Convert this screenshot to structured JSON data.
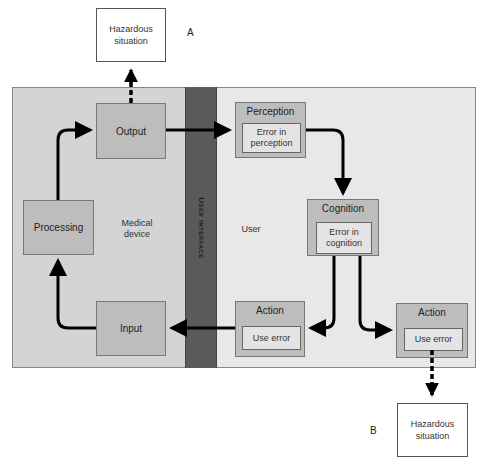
{
  "hazard_top": {
    "line1": "Hazardous",
    "line2": "situation"
  },
  "hazard_bottom": {
    "line1": "Hazardous",
    "line2": "situation"
  },
  "label_a": "A",
  "label_b": "B",
  "device_area": {
    "label_line1": "Medical",
    "label_line2": "device"
  },
  "user_area": {
    "label": "User"
  },
  "user_interface": {
    "label": "User interface"
  },
  "device_boxes": {
    "output": "Output",
    "processing": "Processing",
    "input": "Input"
  },
  "user_boxes": {
    "perception": {
      "title": "Perception",
      "inner_line1": "Error in",
      "inner_line2": "perception"
    },
    "cognition": {
      "title": "Cognition",
      "inner_line1": "Error in",
      "inner_line2": "cognition"
    },
    "action_left": {
      "title": "Action",
      "inner": "Use error"
    },
    "action_right": {
      "title": "Action",
      "inner": "Use error"
    }
  },
  "colors": {
    "device_bg": "#d4d4d4",
    "user_bg": "#e8e8e8",
    "ui_band": "#5a5a5a",
    "box_fill": "#bdbdbd",
    "inner_fill": "#e4e4e4",
    "arrow": "#000000"
  }
}
